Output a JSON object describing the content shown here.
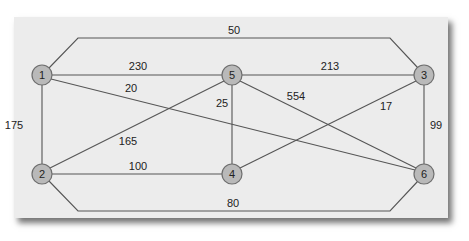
{
  "diagram": {
    "type": "weighted-undirected-graph",
    "nodes": [
      {
        "id": "1",
        "label": "1",
        "x": 42,
        "y": 75
      },
      {
        "id": "5",
        "label": "5",
        "x": 232,
        "y": 75
      },
      {
        "id": "3",
        "label": "3",
        "x": 424,
        "y": 75
      },
      {
        "id": "2",
        "label": "2",
        "x": 42,
        "y": 174
      },
      {
        "id": "4",
        "label": "4",
        "x": 232,
        "y": 174
      },
      {
        "id": "6",
        "label": "6",
        "x": 424,
        "y": 174
      }
    ],
    "edges": [
      {
        "from": "1",
        "to": "3",
        "weight": "50",
        "label_x": 234,
        "label_y": 34
      },
      {
        "from": "1",
        "to": "5",
        "weight": "230",
        "label_x": 138,
        "label_y": 70
      },
      {
        "from": "1",
        "to": "6",
        "weight": "20",
        "label_x": 131,
        "label_y": 92
      },
      {
        "from": "1",
        "to": "2",
        "weight": "175",
        "label_x": 14,
        "label_y": 129
      },
      {
        "from": "5",
        "to": "3",
        "weight": "213",
        "label_x": 330,
        "label_y": 70
      },
      {
        "from": "5",
        "to": "4",
        "weight": "25",
        "label_x": 222,
        "label_y": 107
      },
      {
        "from": "5",
        "to": "6",
        "weight": "554",
        "label_x": 296,
        "label_y": 100
      },
      {
        "from": "5",
        "to": "2",
        "weight": "165",
        "label_x": 128,
        "label_y": 145
      },
      {
        "from": "3",
        "to": "4",
        "weight": "17",
        "label_x": 386,
        "label_y": 110
      },
      {
        "from": "3",
        "to": "6",
        "weight": "99",
        "label_x": 436,
        "label_y": 129
      },
      {
        "from": "2",
        "to": "4",
        "weight": "100",
        "label_x": 138,
        "label_y": 170
      },
      {
        "from": "2",
        "to": "6",
        "weight": "80",
        "label_x": 233,
        "label_y": 207
      }
    ]
  }
}
